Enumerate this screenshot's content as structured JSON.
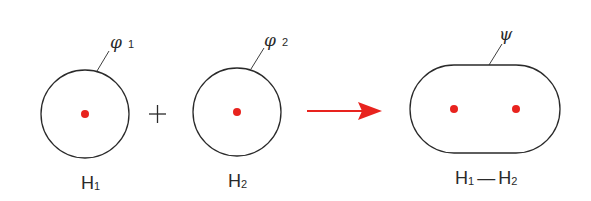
{
  "colors": {
    "outline": "#2a2a2a",
    "nucleus": "#e8231e",
    "arrow": "#e8231e",
    "background": "#ffffff"
  },
  "atoms": [
    {
      "id": "h1",
      "orbital_symbol": "φ",
      "orbital_index": "1",
      "atom_symbol": "H",
      "atom_index": "1"
    },
    {
      "id": "h2",
      "orbital_symbol": "φ",
      "orbital_index": "2",
      "atom_symbol": "H",
      "atom_index": "2"
    }
  ],
  "operator": "+",
  "reaction_arrow": "right-arrow-icon",
  "molecule": {
    "orbital_symbol": "ψ",
    "atom1_symbol": "H",
    "atom1_index": "1",
    "bond": "—",
    "atom2_symbol": "H",
    "atom2_index": "2"
  }
}
